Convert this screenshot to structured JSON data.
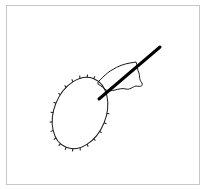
{
  "figure": {
    "frame": {
      "border_color": "#c8c8c8",
      "background": "#ffffff"
    },
    "elements": {
      "cell": {
        "name": "oval-cell",
        "stroke": "#1a1a1a",
        "center": [
          80,
          113
        ],
        "rx": 26,
        "ry": 37,
        "rotation_deg": 22
      },
      "needle": {
        "name": "needle",
        "stroke": "#000000",
        "from": [
          98,
          100
        ],
        "to": [
          160,
          47
        ],
        "width": 3
      },
      "membrane_flap": {
        "name": "membrane-flap",
        "stroke": "#1a1a1a"
      }
    },
    "labels": []
  }
}
